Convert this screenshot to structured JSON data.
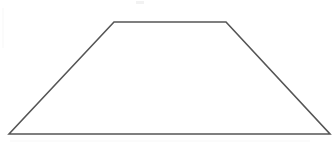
{
  "figure": {
    "shape_name": "trapezoid",
    "background_color": "#ffffff",
    "stroke_color": "#555555",
    "fill_color": "#ffffff",
    "stroke_width": 1.6,
    "canvas": {
      "width": 333,
      "height": 159
    },
    "vertices": [
      {
        "label": "bottom-left",
        "x": 9,
        "y": 134
      },
      {
        "label": "top-left",
        "x": 114,
        "y": 22
      },
      {
        "label": "top-right",
        "x": 226,
        "y": 22
      },
      {
        "label": "bottom-right",
        "x": 330,
        "y": 134
      }
    ],
    "points_attr": "9,134 114,22 226,22 330,134",
    "edges": [
      {
        "name": "bottom-base",
        "from": "bottom-left",
        "to": "bottom-right"
      },
      {
        "name": "left-leg",
        "from": "bottom-left",
        "to": "top-left"
      },
      {
        "name": "top-base",
        "from": "top-left",
        "to": "top-right"
      },
      {
        "name": "right-leg",
        "from": "top-right",
        "to": "bottom-right"
      }
    ],
    "artifacts": [
      {
        "name": "top-center-speck",
        "x": 136,
        "y": 1,
        "width": 8,
        "height": 3
      },
      {
        "name": "left-edge-streak",
        "x": 2,
        "y": 8,
        "width": 2,
        "height": 40
      },
      {
        "name": "bottom-streak",
        "x": 10,
        "y": 140,
        "width": 300,
        "height": 2
      }
    ]
  }
}
